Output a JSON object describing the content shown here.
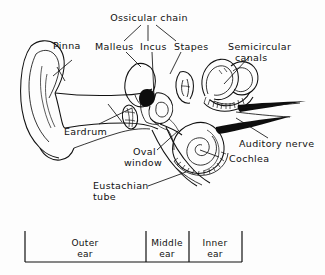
{
  "figure": {
    "title_visible": false,
    "background_color": "#fdfdfd",
    "ink_color": "#111111"
  },
  "labels": {
    "ossicular_chain": "Ossicular chain",
    "pinna": "Pinna",
    "malleus": "Malleus",
    "incus": "Incus",
    "stapes": "Stapes",
    "semicircular_line1": "Semicircular",
    "semicircular_line2": "canals",
    "eardrum": "Eardrum",
    "auditory_nerve": "Auditory nerve",
    "cochlea": "Cochlea",
    "oval_line1": "Oval",
    "oval_line2": "window",
    "eustachian_line1": "Eustachian",
    "eustachian_line2": "tube"
  },
  "regions": {
    "outer_line1": "Outer",
    "outer_line2": "ear",
    "middle_line1": "Middle",
    "middle_line2": "ear",
    "inner_line1": "Inner",
    "inner_line2": "ear"
  }
}
